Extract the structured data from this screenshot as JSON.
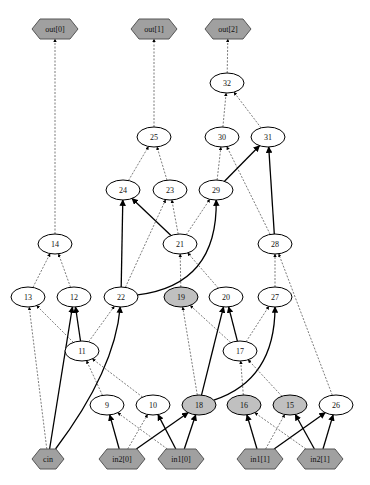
{
  "diagram": {
    "type": "directed-graph",
    "colors": {
      "io_node_fill": "#a0a0a0",
      "gray_node_fill": "#c0c0c0",
      "plain_node_fill": "#ffffff",
      "edge": "#000000"
    },
    "nodes": [
      {
        "id": "out0",
        "label": "out[0]",
        "shape": "hexagon",
        "style": "io"
      },
      {
        "id": "out1",
        "label": "out[1]",
        "shape": "hexagon",
        "style": "io"
      },
      {
        "id": "out2",
        "label": "out[2]",
        "shape": "hexagon",
        "style": "io"
      },
      {
        "id": "n32",
        "label": "32",
        "shape": "ellipse",
        "style": "plain"
      },
      {
        "id": "n25",
        "label": "25",
        "shape": "ellipse",
        "style": "plain"
      },
      {
        "id": "n30",
        "label": "30",
        "shape": "ellipse",
        "style": "plain"
      },
      {
        "id": "n31",
        "label": "31",
        "shape": "ellipse",
        "style": "plain"
      },
      {
        "id": "n24",
        "label": "24",
        "shape": "ellipse",
        "style": "plain"
      },
      {
        "id": "n23",
        "label": "23",
        "shape": "ellipse",
        "style": "plain"
      },
      {
        "id": "n29",
        "label": "29",
        "shape": "ellipse",
        "style": "plain"
      },
      {
        "id": "n14",
        "label": "14",
        "shape": "ellipse",
        "style": "plain"
      },
      {
        "id": "n21",
        "label": "21",
        "shape": "ellipse",
        "style": "plain"
      },
      {
        "id": "n28",
        "label": "28",
        "shape": "ellipse",
        "style": "plain"
      },
      {
        "id": "n13",
        "label": "13",
        "shape": "ellipse",
        "style": "plain"
      },
      {
        "id": "n12",
        "label": "12",
        "shape": "ellipse",
        "style": "plain"
      },
      {
        "id": "n22",
        "label": "22",
        "shape": "ellipse",
        "style": "plain"
      },
      {
        "id": "n19",
        "label": "19",
        "shape": "ellipse",
        "style": "gray"
      },
      {
        "id": "n20",
        "label": "20",
        "shape": "ellipse",
        "style": "plain"
      },
      {
        "id": "n27",
        "label": "27",
        "shape": "ellipse",
        "style": "plain"
      },
      {
        "id": "n11",
        "label": "11",
        "shape": "ellipse",
        "style": "plain"
      },
      {
        "id": "n17",
        "label": "17",
        "shape": "ellipse",
        "style": "plain"
      },
      {
        "id": "n9",
        "label": "9",
        "shape": "ellipse",
        "style": "plain"
      },
      {
        "id": "n10",
        "label": "10",
        "shape": "ellipse",
        "style": "plain"
      },
      {
        "id": "n18",
        "label": "18",
        "shape": "ellipse",
        "style": "gray"
      },
      {
        "id": "n16",
        "label": "16",
        "shape": "ellipse",
        "style": "gray"
      },
      {
        "id": "n15",
        "label": "15",
        "shape": "ellipse",
        "style": "gray"
      },
      {
        "id": "n26",
        "label": "26",
        "shape": "ellipse",
        "style": "plain"
      },
      {
        "id": "cin",
        "label": "cin",
        "shape": "hexagon",
        "style": "io"
      },
      {
        "id": "in2_0",
        "label": "in2[0]",
        "shape": "hexagon",
        "style": "io"
      },
      {
        "id": "in1_0",
        "label": "in1[0]",
        "shape": "hexagon",
        "style": "io"
      },
      {
        "id": "in1_1",
        "label": "in1[1]",
        "shape": "hexagon",
        "style": "io"
      },
      {
        "id": "in2_1",
        "label": "in2[1]",
        "shape": "hexagon",
        "style": "io"
      }
    ],
    "edges": [
      {
        "from": "n14",
        "to": "out0",
        "style": "dashed"
      },
      {
        "from": "n25",
        "to": "out1",
        "style": "dashed"
      },
      {
        "from": "n32",
        "to": "out2",
        "style": "dashed"
      },
      {
        "from": "n30",
        "to": "n32",
        "style": "dashed"
      },
      {
        "from": "n31",
        "to": "n32",
        "style": "dashed"
      },
      {
        "from": "n24",
        "to": "n25",
        "style": "dashed"
      },
      {
        "from": "n23",
        "to": "n25",
        "style": "dashed"
      },
      {
        "from": "n29",
        "to": "n30",
        "style": "dashed"
      },
      {
        "from": "n28",
        "to": "n30",
        "style": "dashed"
      },
      {
        "from": "n29",
        "to": "n31",
        "style": "solid"
      },
      {
        "from": "n28",
        "to": "n31",
        "style": "solid"
      },
      {
        "from": "n22",
        "to": "n24",
        "style": "solid"
      },
      {
        "from": "n21",
        "to": "n24",
        "style": "solid"
      },
      {
        "from": "n22",
        "to": "n23",
        "style": "dashed"
      },
      {
        "from": "n21",
        "to": "n23",
        "style": "dashed"
      },
      {
        "from": "n21",
        "to": "n29",
        "style": "dashed"
      },
      {
        "from": "n22",
        "to": "n29",
        "style": "solid",
        "curved": true
      },
      {
        "from": "n13",
        "to": "n14",
        "style": "dashed"
      },
      {
        "from": "n12",
        "to": "n14",
        "style": "dashed"
      },
      {
        "from": "n19",
        "to": "n21",
        "style": "dashed"
      },
      {
        "from": "n20",
        "to": "n21",
        "style": "dashed"
      },
      {
        "from": "n27",
        "to": "n28",
        "style": "dashed"
      },
      {
        "from": "n26",
        "to": "n28",
        "style": "dashed"
      },
      {
        "from": "n11",
        "to": "n13",
        "style": "dashed"
      },
      {
        "from": "n11",
        "to": "n12",
        "style": "solid"
      },
      {
        "from": "n11",
        "to": "n22",
        "style": "dashed"
      },
      {
        "from": "cin",
        "to": "n13",
        "style": "dashed"
      },
      {
        "from": "cin",
        "to": "n12",
        "style": "solid"
      },
      {
        "from": "cin",
        "to": "n22",
        "style": "solid",
        "curved": true
      },
      {
        "from": "n17",
        "to": "n19",
        "style": "dashed"
      },
      {
        "from": "n17",
        "to": "n20",
        "style": "solid"
      },
      {
        "from": "n17",
        "to": "n27",
        "style": "dashed"
      },
      {
        "from": "n18",
        "to": "n19",
        "style": "dashed"
      },
      {
        "from": "n18",
        "to": "n20",
        "style": "solid"
      },
      {
        "from": "n18",
        "to": "n27",
        "style": "solid",
        "curved": true
      },
      {
        "from": "n9",
        "to": "n11",
        "style": "dashed"
      },
      {
        "from": "n10",
        "to": "n11",
        "style": "dashed"
      },
      {
        "from": "n16",
        "to": "n17",
        "style": "dashed"
      },
      {
        "from": "n15",
        "to": "n17",
        "style": "dashed"
      },
      {
        "from": "in2_0",
        "to": "n9",
        "style": "solid"
      },
      {
        "from": "in2_0",
        "to": "n10",
        "style": "dashed"
      },
      {
        "from": "in2_0",
        "to": "n18",
        "style": "solid"
      },
      {
        "from": "in1_0",
        "to": "n9",
        "style": "dashed"
      },
      {
        "from": "in1_0",
        "to": "n10",
        "style": "solid"
      },
      {
        "from": "in1_0",
        "to": "n18",
        "style": "solid"
      },
      {
        "from": "in1_1",
        "to": "n16",
        "style": "solid"
      },
      {
        "from": "in1_1",
        "to": "n15",
        "style": "dashed"
      },
      {
        "from": "in1_1",
        "to": "n26",
        "style": "solid"
      },
      {
        "from": "in2_1",
        "to": "n16",
        "style": "dashed"
      },
      {
        "from": "in2_1",
        "to": "n15",
        "style": "solid"
      },
      {
        "from": "in2_1",
        "to": "n26",
        "style": "solid"
      }
    ]
  }
}
